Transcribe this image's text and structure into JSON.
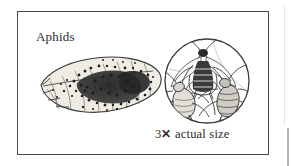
{
  "figure": {
    "title_label": "Aphids",
    "scale_number": "3",
    "scale_symbol": "✕",
    "scale_caption": "actual size",
    "full_caption": "3✕ actual size",
    "background_color": "#ffffff",
    "ink_color": "#2b2b2b",
    "frame_color": "#4a4a4a"
  },
  "illustration": {
    "leaf": {
      "name": "leaf-with-aphid-colony",
      "description": "Serrated oval leaf in three-quarter view covered by a dense dark colony of aphids",
      "fill_color": "#efece4",
      "outline_color": "#3a3a3a",
      "colony_color": "#2a2a2a"
    },
    "magnifier": {
      "name": "magnified-inset-circle",
      "description": "Circular magnified inset showing three aphids at three times actual size",
      "outline_color": "#3a3a3a",
      "insect_count": 3,
      "insects": [
        {
          "name": "winged-aphid",
          "position": "top",
          "has_wings": true,
          "description": "Winged adult aphid with striped abdomen, antennae and six legs"
        },
        {
          "name": "aphid-nymph-left",
          "position": "lower-left",
          "has_wings": false,
          "description": "Wingless aphid nymph facing right with long antennae"
        },
        {
          "name": "aphid-nymph-right",
          "position": "lower-right",
          "has_wings": false,
          "description": "Wingless aphid nymph with banded abdomen and cornicles"
        }
      ]
    }
  }
}
